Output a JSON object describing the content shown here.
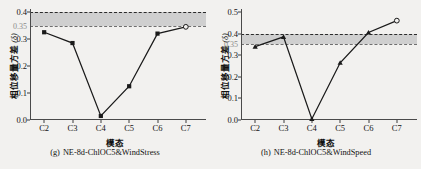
{
  "figure": {
    "background": "#f2f1ef",
    "band_color": "#c9c9c9",
    "line_color": "#1a1a1a"
  },
  "panels": [
    {
      "key": "g",
      "caption_tag": "(g)",
      "caption_text": "NE-8d-ChlOC5&WindStress",
      "ylabel": "相位移量方差",
      "ylabel_symbol": "(δ)",
      "xlabel": "模态",
      "chart_data": {
        "type": "line",
        "title": "(g) NE-8d-ChlOC5&WindStress",
        "xlabel": "模态",
        "ylabel": "相位移量方差 (δ)",
        "categories": [
          "C2",
          "C3",
          "C4",
          "C5",
          "C6",
          "C7"
        ],
        "values": [
          0.325,
          0.285,
          0.015,
          0.125,
          0.32,
          0.345
        ],
        "ylim": [
          0.0,
          0.4
        ],
        "yticks": [
          0.0,
          0.1,
          0.2,
          0.3,
          0.4
        ],
        "ytick_labels": [
          "0.0",
          "0.1",
          "0.2",
          "0.3",
          "0.4"
        ],
        "extra_ytick": 0.35,
        "extra_ytick_label": "0.35",
        "band": [
          0.35,
          0.4
        ],
        "grid": false,
        "legend": "none",
        "marker": "square",
        "last_marker": "open-circle"
      }
    },
    {
      "key": "h",
      "caption_tag": "(h)",
      "caption_text": "NE-8d-ChlOC5&WindSpeed",
      "ylabel": "相位移量方差",
      "ylabel_symbol": "(δ)",
      "xlabel": "模态",
      "chart_data": {
        "type": "line",
        "title": "(h) NE-8d-ChlOC5&WindSpeed",
        "xlabel": "模态",
        "ylabel": "相位移量方差 (δ)",
        "categories": [
          "C2",
          "C3",
          "C4",
          "C5",
          "C6",
          "C7"
        ],
        "values": [
          0.34,
          0.385,
          0.005,
          0.265,
          0.405,
          0.46
        ],
        "ylim": [
          0.0,
          0.5
        ],
        "yticks": [
          0.0,
          0.1,
          0.2,
          0.3,
          0.4,
          0.5
        ],
        "ytick_labels": [
          "0.0",
          "0.1",
          "0.2",
          "0.3",
          "0.4",
          "0.5"
        ],
        "extra_ytick": 0.35,
        "extra_ytick_label": "0.35",
        "band": [
          0.35,
          0.4
        ],
        "grid": false,
        "legend": "none",
        "marker": "triangle",
        "last_marker": "open-circle"
      }
    }
  ]
}
